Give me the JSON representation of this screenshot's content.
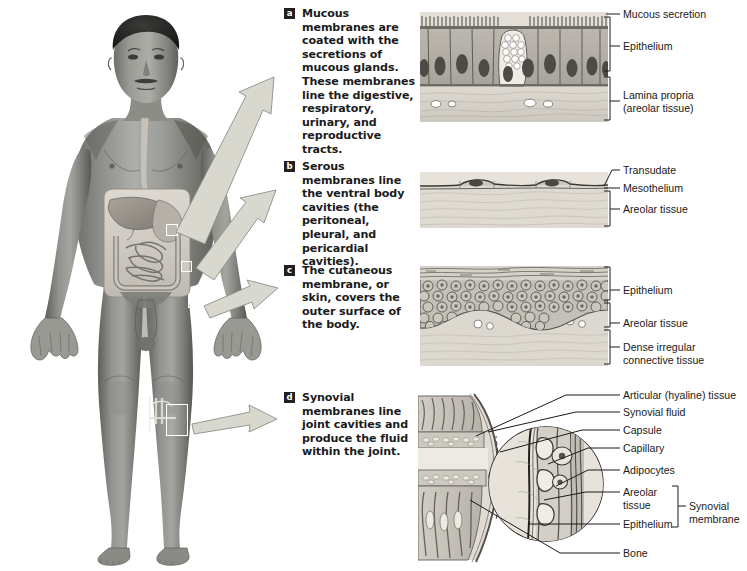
{
  "figure": {
    "subject_figure": "anterior view of human male body showing sites of mucous, serous, cutaneous, and synovial membranes",
    "marker_boxes": 4,
    "callout_arrow_count": 4,
    "colors": {
      "arrow_fill": "#d9d8cf",
      "arrow_stroke": "#8d8d85",
      "badge_bg": "#231f20",
      "badge_text": "#ffffff",
      "label_text": "#1a1a1a",
      "leader_line": "#1a1a1a",
      "panel_tint_a": "#b9b5ad",
      "panel_tint_b": "#cfcbc2",
      "panel_tint_c": "#c3bfb6",
      "panel_tint_d": "#bdb9b0"
    }
  },
  "items": [
    {
      "letter": "a",
      "text": "Mucous membranes are coated with the secretions of mucous glands. These membranes line the digestive, respiratory, urinary, and reproductive tracts.",
      "panel_kind": "columnar-epithelium-with-goblet-cell",
      "labels": [
        {
          "name": "mucous-secretion",
          "text": "Mucous secretion",
          "type": "line"
        },
        {
          "name": "epithelium",
          "text": "Epithelium",
          "type": "bracket"
        },
        {
          "name": "lamina-propria",
          "text": "Lamina propria\n(areolar tissue)",
          "type": "bracket"
        }
      ]
    },
    {
      "letter": "b",
      "text": "Serous membranes line the ventral body cavities (the peritoneal, pleural, and pericardial cavities).",
      "panel_kind": "squamous-mesothelium-over-areolar-tissue",
      "labels": [
        {
          "name": "transudate",
          "text": "Transudate",
          "type": "arrow"
        },
        {
          "name": "mesothelium",
          "text": "Mesothelium",
          "type": "line"
        },
        {
          "name": "areolar-tissue",
          "text": "Areolar tissue",
          "type": "bracket"
        }
      ]
    },
    {
      "letter": "c",
      "text": "The cutaneous membrane, or skin, covers the outer surface of the body.",
      "panel_kind": "stratified-squamous-epithelium-over-dermis",
      "labels": [
        {
          "name": "epithelium",
          "text": "Epithelium",
          "type": "bracket"
        },
        {
          "name": "areolar-tissue",
          "text": "Areolar tissue",
          "type": "bracket"
        },
        {
          "name": "dense-irregular-connective-tissue",
          "text": "Dense irregular\nconnective tissue",
          "type": "bracket"
        }
      ]
    },
    {
      "letter": "d",
      "text": "Synovial membranes line joint cavities and produce the fluid within the joint.",
      "panel_kind": "joint-section-with-magnified-inset",
      "labels": [
        {
          "name": "articular-hyaline-tissue",
          "text": "Articular (hyaline) tissue",
          "type": "line"
        },
        {
          "name": "synovial-fluid",
          "text": "Synovial fluid",
          "type": "line"
        },
        {
          "name": "capsule",
          "text": "Capsule",
          "type": "line"
        },
        {
          "name": "capillary",
          "text": "Capillary",
          "type": "line"
        },
        {
          "name": "adipocytes",
          "text": "Adipocytes",
          "type": "line"
        },
        {
          "name": "areolar-tissue",
          "text": "Areolar\ntissue",
          "type": "line"
        },
        {
          "name": "epithelium",
          "text": "Epithelium",
          "type": "line"
        },
        {
          "name": "synovial-membrane",
          "text": "Synovial\nmembrane",
          "type": "bracket-group"
        },
        {
          "name": "bone",
          "text": "Bone",
          "type": "line"
        }
      ]
    }
  ]
}
